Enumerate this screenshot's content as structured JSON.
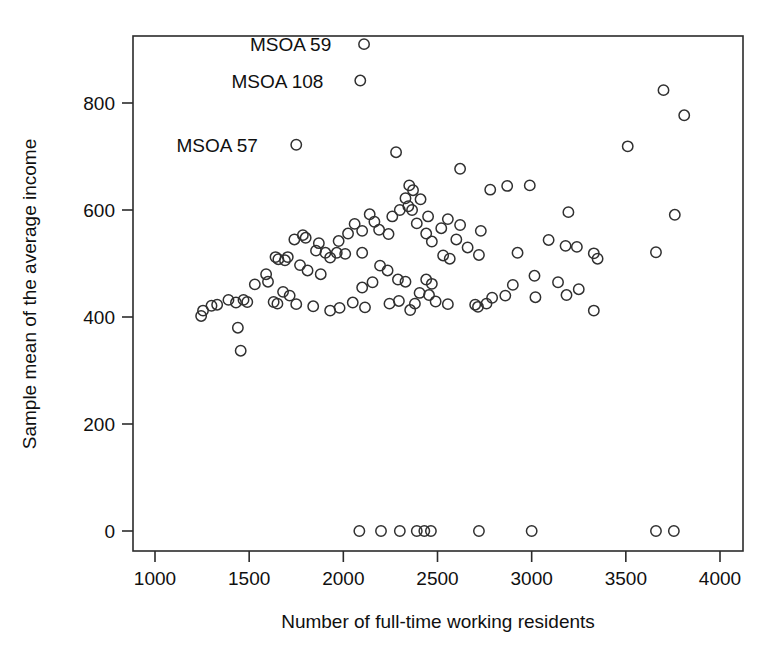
{
  "chart_data": {
    "type": "scatter",
    "title": "",
    "xlabel": "Number of full-time working residents",
    "ylabel": "Sample mean of the average income",
    "xlim": [
      900,
      4090
    ],
    "ylim": [
      -35,
      955
    ],
    "xticks": [
      1000,
      1500,
      2000,
      2500,
      3000,
      3500,
      4000
    ],
    "xtick_labels": [
      "1000",
      "1500",
      "2000",
      "2500",
      "3000",
      "3500",
      "4000"
    ],
    "yticks": [
      0,
      200,
      400,
      600,
      800
    ],
    "ytick_labels": [
      "0",
      "200",
      "400",
      "600",
      "800"
    ],
    "grid": false,
    "legend": "none",
    "marker": "open-circle",
    "annotations": [
      {
        "label": "MSOA 59",
        "x": 2110,
        "y": 910,
        "text_x": 1720,
        "text_y": 910
      },
      {
        "label": "MSOA 108",
        "x": 2090,
        "y": 842,
        "text_x": 1650,
        "text_y": 842
      },
      {
        "label": "MSOA 57",
        "x": 1750,
        "y": 722,
        "text_x": 1330,
        "text_y": 722
      }
    ],
    "points": [
      [
        2110,
        910
      ],
      [
        2090,
        842
      ],
      [
        1750,
        722
      ],
      [
        2280,
        708
      ],
      [
        2620,
        677
      ],
      [
        3510,
        719
      ],
      [
        3700,
        824
      ],
      [
        3810,
        777
      ],
      [
        2350,
        646
      ],
      [
        2370,
        637
      ],
      [
        2330,
        622
      ],
      [
        2410,
        620
      ],
      [
        2345,
        607
      ],
      [
        2365,
        600
      ],
      [
        2870,
        645
      ],
      [
        2990,
        646
      ],
      [
        2780,
        638
      ],
      [
        3195,
        596
      ],
      [
        3760,
        591
      ],
      [
        2300,
        600
      ],
      [
        2260,
        588
      ],
      [
        2140,
        592
      ],
      [
        2165,
        578
      ],
      [
        2060,
        574
      ],
      [
        2390,
        575
      ],
      [
        2450,
        588
      ],
      [
        2555,
        583
      ],
      [
        2620,
        572
      ],
      [
        2520,
        566
      ],
      [
        2730,
        561
      ],
      [
        2100,
        561
      ],
      [
        2190,
        563
      ],
      [
        2025,
        556
      ],
      [
        1785,
        553
      ],
      [
        1800,
        548
      ],
      [
        1740,
        545
      ],
      [
        1870,
        538
      ],
      [
        1975,
        542
      ],
      [
        2240,
        555
      ],
      [
        2440,
        556
      ],
      [
        2470,
        541
      ],
      [
        2600,
        545
      ],
      [
        2660,
        530
      ],
      [
        2720,
        516
      ],
      [
        3180,
        533
      ],
      [
        3240,
        531
      ],
      [
        3660,
        521
      ],
      [
        3330,
        519
      ],
      [
        3350,
        509
      ],
      [
        3090,
        544
      ],
      [
        2925,
        520
      ],
      [
        1640,
        512
      ],
      [
        1655,
        508
      ],
      [
        1690,
        506
      ],
      [
        1705,
        512
      ],
      [
        1855,
        524
      ],
      [
        1905,
        520
      ],
      [
        1930,
        511
      ],
      [
        1965,
        520
      ],
      [
        2010,
        518
      ],
      [
        2100,
        520
      ],
      [
        2530,
        515
      ],
      [
        2565,
        509
      ],
      [
        1770,
        497
      ],
      [
        1810,
        487
      ],
      [
        1880,
        480
      ],
      [
        2195,
        496
      ],
      [
        2235,
        487
      ],
      [
        2290,
        470
      ],
      [
        2330,
        466
      ],
      [
        2440,
        470
      ],
      [
        2470,
        462
      ],
      [
        2155,
        465
      ],
      [
        2100,
        455
      ],
      [
        1590,
        480
      ],
      [
        1600,
        466
      ],
      [
        1530,
        461
      ],
      [
        1470,
        432
      ],
      [
        1490,
        428
      ],
      [
        1430,
        427
      ],
      [
        1390,
        432
      ],
      [
        1330,
        423
      ],
      [
        1300,
        421
      ],
      [
        1255,
        412
      ],
      [
        1245,
        402
      ],
      [
        1680,
        447
      ],
      [
        1715,
        440
      ],
      [
        1630,
        428
      ],
      [
        1650,
        425
      ],
      [
        1750,
        424
      ],
      [
        1840,
        420
      ],
      [
        1930,
        412
      ],
      [
        1980,
        417
      ],
      [
        2050,
        427
      ],
      [
        2115,
        418
      ],
      [
        2245,
        425
      ],
      [
        2295,
        430
      ],
      [
        2355,
        413
      ],
      [
        2380,
        425
      ],
      [
        2405,
        445
      ],
      [
        2455,
        441
      ],
      [
        2490,
        429
      ],
      [
        2555,
        424
      ],
      [
        2700,
        423
      ],
      [
        2715,
        419
      ],
      [
        2760,
        425
      ],
      [
        2790,
        436
      ],
      [
        2860,
        440
      ],
      [
        2900,
        460
      ],
      [
        3015,
        477
      ],
      [
        3140,
        465
      ],
      [
        3185,
        441
      ],
      [
        3250,
        452
      ],
      [
        3330,
        412
      ],
      [
        3020,
        437
      ],
      [
        1440,
        380
      ],
      [
        1455,
        337
      ],
      [
        2085,
        0
      ],
      [
        2200,
        0
      ],
      [
        2300,
        0
      ],
      [
        2390,
        0
      ],
      [
        2430,
        0
      ],
      [
        2465,
        0
      ],
      [
        2720,
        0
      ],
      [
        3000,
        0
      ],
      [
        3660,
        0
      ],
      [
        3755,
        0
      ]
    ]
  }
}
